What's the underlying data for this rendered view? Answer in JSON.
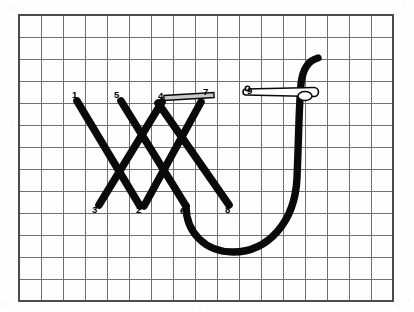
{
  "figure": {
    "type": "instructional-line-drawing",
    "background_color": "#fefefe",
    "grid": {
      "line_color": "#6f6f74",
      "border_color": "#4a4a50",
      "origin_x": 19,
      "origin_y": 15,
      "cell_size": 22,
      "columns": 17,
      "rows": 13
    },
    "stroke_color": "#0a0a0a",
    "needle_fill": "#ffffff",
    "flat_thread_fill": "#c9c9cc"
  },
  "labels": [
    {
      "id": "1",
      "text": "1",
      "x": 72,
      "y": 98
    },
    {
      "id": "2",
      "text": "2",
      "x": 136,
      "y": 213
    },
    {
      "id": "3",
      "text": "3",
      "x": 92,
      "y": 213
    },
    {
      "id": "4",
      "text": "4",
      "x": 158,
      "y": 99
    },
    {
      "id": "5",
      "text": "5",
      "x": 114,
      "y": 98
    },
    {
      "id": "6",
      "text": "6",
      "x": 180,
      "y": 214
    },
    {
      "id": "7",
      "text": "7",
      "x": 203,
      "y": 95
    },
    {
      "id": "8",
      "text": "8",
      "x": 225,
      "y": 213
    },
    {
      "id": "9",
      "text": "9",
      "x": 247,
      "y": 94
    }
  ],
  "stitches": [
    {
      "name": "stitch-1-to-2",
      "from": "1",
      "to": "2",
      "x1": 77,
      "y1": 101,
      "x2": 140,
      "y2": 206
    },
    {
      "name": "stitch-3-to-4",
      "from": "3",
      "to": "4",
      "x1": 99,
      "y1": 205,
      "x2": 162,
      "y2": 102
    },
    {
      "name": "stitch-5-to-6",
      "from": "5",
      "to": "6",
      "x1": 121,
      "y1": 101,
      "x2": 186,
      "y2": 206
    },
    {
      "name": "stitch-7-to-8",
      "from": "7",
      "to": "8",
      "x1": 158,
      "y1": 103,
      "x2": 229,
      "y2": 205
    },
    {
      "name": "stitch-right-upper",
      "from": "6",
      "to": "top",
      "x1": 144,
      "y1": 206,
      "x2": 201,
      "y2": 102
    }
  ],
  "thread": {
    "name": "working-thread",
    "path": "M 186 206 C 186 232, 205 252, 233 252 C 268 252, 295 222, 297 178 C 299 130, 299 104, 301 84 C 303 66, 310 60, 318 58"
  },
  "needle": {
    "name": "sewing-needle",
    "x": 246,
    "y": 92,
    "length": 68,
    "thickness": 9,
    "eye_cx": 305,
    "eye_cy": 96,
    "eye_rx": 7,
    "eye_ry": 4.5
  },
  "flat_thread": {
    "name": "thread-segment-4-to-7",
    "x1": 164,
    "y1": 98,
    "x2": 214,
    "y2": 95,
    "thickness": 5
  }
}
